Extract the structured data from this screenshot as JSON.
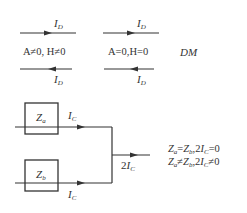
{
  "diagram": {
    "top": {
      "left_pair": {
        "top_label": {
          "var": "I",
          "sub": "D"
        },
        "condition": "A≠0, H≠0",
        "bottom_label": {
          "var": "I",
          "sub": "D"
        }
      },
      "right_pair": {
        "top_label": {
          "var": "I",
          "sub": "D"
        },
        "condition": "A=0,H=0",
        "bottom_label": {
          "var": "I",
          "sub": "D"
        }
      },
      "mode_label": "DM"
    },
    "bottom": {
      "box_a": {
        "var": "Z",
        "sub": "a"
      },
      "box_b": {
        "var": "Z",
        "sub": "b"
      },
      "current_a": {
        "var": "I",
        "sub": "C"
      },
      "current_b": {
        "var": "I",
        "sub": "C"
      },
      "output_current": {
        "prefix": "2",
        "var": "I",
        "sub": "C"
      },
      "equations": [
        "Zₐ=Zᵦ,2Iᴄ=0",
        "Zₐ≠Zᵦ,2Iᴄ≠0"
      ],
      "equation_parts": [
        {
          "z1": "Z",
          "s1": "a",
          "op": "=",
          "z2": "Z",
          "s2": "b",
          "rest_pre": ",2",
          "i": "I",
          "si": "C",
          "rest_post": "=0"
        },
        {
          "z1": "Z",
          "s1": "a",
          "op": "≠",
          "z2": "Z",
          "s2": "b",
          "rest_pre": ",2",
          "i": "I",
          "si": "C",
          "rest_post": "≠0"
        }
      ]
    },
    "colors": {
      "line": "#333333",
      "text": "#333333",
      "background": "#ffffff"
    }
  }
}
